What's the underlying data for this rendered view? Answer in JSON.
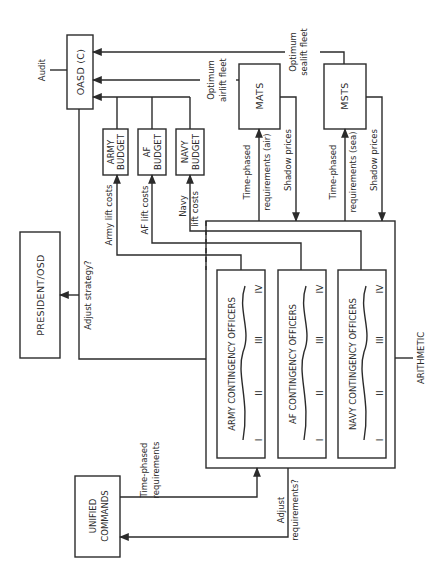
{
  "diagram": {
    "orientation": "rotated 90deg counter-clockwise",
    "nodes": {
      "oasd": "OASD (C)",
      "army_budget": [
        "ARMY",
        "BUDGET"
      ],
      "af_budget": [
        "AF",
        "BUDGET"
      ],
      "navy_budget": [
        "NAVY",
        "BUDGET"
      ],
      "mats": "MATS",
      "msts": "MSTS",
      "president": "PRESIDENT/OSD",
      "unified_commands": [
        "UNIFIED",
        "COMMANDS"
      ],
      "army_co": "ARMY CONTINGENCY OFFICERS",
      "af_co": "AF CONTINGENCY OFFICERS",
      "navy_co": "NAVY CONTINGENCY OFFICERS"
    },
    "roman_numerals": [
      "I",
      "II",
      "III",
      "IV"
    ],
    "labels": {
      "audit": "Audit",
      "optimum_airlift": [
        "Optimum",
        "airlift fleet"
      ],
      "optimum_sealift": [
        "Optimum",
        "sealift fleet"
      ],
      "army_lift_costs": "Army lift costs",
      "af_lift_costs": "AF lift costs",
      "navy_lift_costs": [
        "Navy",
        "lift costs"
      ],
      "time_phased_air": [
        "Time-phased",
        "requirements (air)"
      ],
      "time_phased_sea": [
        "Time-phased",
        "requirements (sea)"
      ],
      "shadow_prices_air": "Shadow prices",
      "shadow_prices_sea": "Shadow prices",
      "adjust_strategy": "Adjust strategy?",
      "time_phased_uc": [
        "Time-phased",
        "requirements"
      ],
      "adjust_requirements": [
        "Adjust",
        "requirements?"
      ],
      "arithmetic": "ARITHMETIC"
    },
    "colors": {
      "ink": "#2b2b2b",
      "paper": "#ffffff"
    }
  }
}
